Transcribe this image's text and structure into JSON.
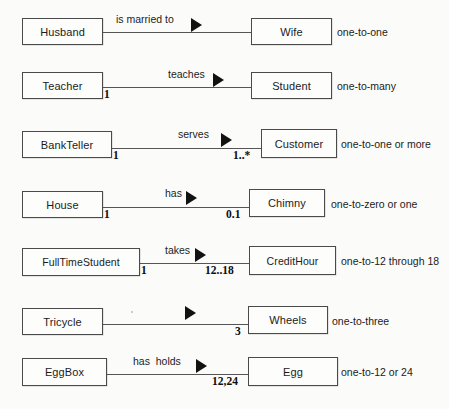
{
  "diagram": {
    "background_color": "#fbfbf9",
    "line_color": "#555555",
    "arrow_color": "#121212",
    "text_color": "#1b1b1b",
    "rows": [
      {
        "id": "husband-wife",
        "left_entity": "Husband",
        "relationship": "is married to",
        "right_entity": "Wife",
        "left_cardinality": "",
        "right_cardinality": "",
        "description": "one-to-one"
      },
      {
        "id": "teacher-student",
        "left_entity": "Teacher",
        "relationship": "teaches",
        "right_entity": "Student",
        "left_cardinality": "1",
        "right_cardinality": "",
        "description": "one-to-many"
      },
      {
        "id": "bankteller-customer",
        "left_entity": "BankTeller",
        "relationship": "serves",
        "right_entity": "Customer",
        "left_cardinality": "1",
        "right_cardinality": "1..*",
        "description": "one-to-one or more"
      },
      {
        "id": "house-chimny",
        "left_entity": "House",
        "relationship": "has",
        "right_entity": "Chimny",
        "left_cardinality": "1",
        "right_cardinality": "0.1",
        "description": "one-to-zero or one"
      },
      {
        "id": "fulltimestudent-credithour",
        "left_entity": "FullTimeStudent",
        "relationship": "takes",
        "right_entity": "CreditHour",
        "left_cardinality": "1",
        "right_cardinality": "12..18",
        "description": "one-to-12 through 18"
      },
      {
        "id": "tricycle-wheels",
        "left_entity": "Tricycle",
        "relationship": "",
        "right_entity": "Wheels",
        "left_cardinality": "",
        "right_cardinality": "3",
        "description": "one-to-three"
      },
      {
        "id": "eggbox-egg",
        "left_entity": "EggBox",
        "relationship": "has  holds",
        "right_entity": "Egg",
        "left_cardinality": "",
        "right_cardinality": "12,24",
        "description": "one-to-12 or 24"
      }
    ]
  }
}
